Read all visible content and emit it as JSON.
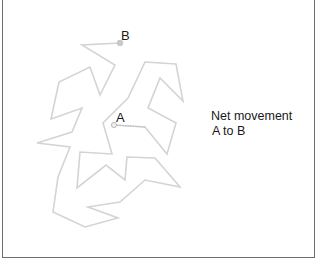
{
  "diagram": {
    "points": {
      "start": {
        "label": "A",
        "x": 114,
        "y": 125
      },
      "end": {
        "label": "B",
        "x": 120,
        "y": 43
      }
    },
    "caption": {
      "line1": "Net movement",
      "line2": "A to B"
    },
    "path_points": "114,125 145,127 167,154 176,123 148,108 160,78 183,101 176,64 145,62 128,98 103,123 112,154 80,152 77,188 106,165 125,180 127,157 155,158 180,187 145,180 120,202 88,207 118,218 85,227 53,212 58,177 70,147 37,143 72,132 82,108 51,119 59,82 90,67 100,95 115,65 82,45 120,43",
    "colors": {
      "path": "#d4d4d4",
      "start_marker": "#c8c8c8",
      "end_marker": "#c9c9c9",
      "frame": "#6d6d6d",
      "text": "#1a1a1a"
    }
  }
}
